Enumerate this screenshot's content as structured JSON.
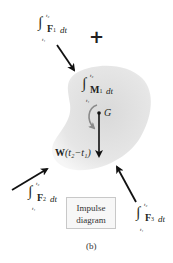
{
  "figure": {
    "caption": "(b)",
    "title_box": {
      "line1": "Impulse",
      "line2": "diagram"
    },
    "plus_sign": "+",
    "colors": {
      "body_fill": "#e6e6e6",
      "body_edge": "#ffffff",
      "arrow": "#111111",
      "moment_arrow": "#8a8a8a",
      "text": "#231f20",
      "box_border": "#c8c8c8",
      "box_fill": "#f7f7f7"
    }
  },
  "impulses": {
    "F1": {
      "integral": "∫",
      "upper": "t₂",
      "lower": "t₁",
      "vector": "F",
      "subscript": "1",
      "dt": "dt"
    },
    "M1": {
      "integral": "∫",
      "upper": "t₂",
      "lower": "t₁",
      "vector": "M",
      "subscript": "1",
      "dt": "dt"
    },
    "F2": {
      "integral": "∫",
      "upper": "t₂",
      "lower": "t₁",
      "vector": "F",
      "subscript": "2",
      "dt": "dt"
    },
    "F3": {
      "integral": "∫",
      "upper": "t₂",
      "lower": "t₁",
      "vector": "F",
      "subscript": "3",
      "dt": "dt"
    },
    "weight": {
      "symbol": "W",
      "expr": "(t₂−t₁)"
    }
  },
  "center_of_mass": {
    "label": "G"
  }
}
